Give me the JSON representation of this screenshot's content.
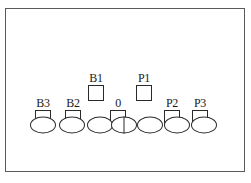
{
  "diagram": {
    "frame": {
      "name": "outer-panel-border",
      "stroke_color": "#5a5a5a",
      "fill_color": "#ffffff"
    },
    "markers": [
      {
        "label": "B3",
        "x": 43,
        "box_y": 110,
        "row": "lower"
      },
      {
        "label": "B2",
        "x": 73,
        "box_y": 110,
        "row": "lower"
      },
      {
        "label": "B1",
        "x": 96,
        "box_y": 85,
        "row": "upper"
      },
      {
        "label": "0",
        "x": 118,
        "box_y": 110,
        "row": "lower"
      },
      {
        "label": "P1",
        "x": 144,
        "box_y": 85,
        "row": "upper"
      },
      {
        "label": "P2",
        "x": 172,
        "box_y": 110,
        "row": "lower"
      },
      {
        "label": "P3",
        "x": 200,
        "box_y": 110,
        "row": "lower"
      }
    ],
    "ellipses": [
      {
        "index": 1,
        "x": 43,
        "y": 125,
        "divided": false
      },
      {
        "index": 2,
        "x": 72,
        "y": 125,
        "divided": false
      },
      {
        "index": 3,
        "x": 100,
        "y": 125,
        "divided": false
      },
      {
        "index": 4,
        "x": 124,
        "y": 125,
        "divided": true
      },
      {
        "index": 5,
        "x": 150,
        "y": 125,
        "divided": false
      },
      {
        "index": 6,
        "x": 177,
        "y": 125,
        "divided": false
      },
      {
        "index": 7,
        "x": 204,
        "y": 125,
        "divided": false
      }
    ],
    "colors": {
      "stroke": "#2a2a2a",
      "frame_stroke": "#5a5a5a",
      "background": "#ffffff",
      "text": "#1a1a1a"
    }
  }
}
